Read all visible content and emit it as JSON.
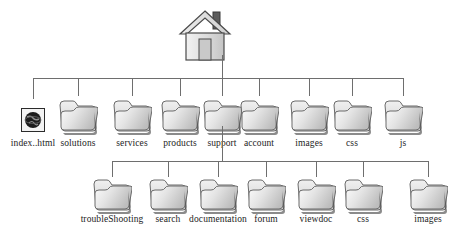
{
  "diagram": {
    "type": "site-map-tree",
    "background_color": "#ffffff",
    "line_color": "#6e6e6e",
    "root": {
      "icon": "house-icon",
      "label": ""
    },
    "level1": [
      {
        "label": "index..html",
        "icon": "globe-icon",
        "x": 33
      },
      {
        "label": "solutions",
        "icon": "folder-icon",
        "x": 78
      },
      {
        "label": "services",
        "icon": "folder-icon",
        "x": 132
      },
      {
        "label": "products",
        "icon": "folder-icon",
        "x": 180
      },
      {
        "label": "support",
        "icon": "folder-icon",
        "x": 222
      },
      {
        "label": "account",
        "icon": "folder-icon",
        "x": 259
      },
      {
        "label": "images",
        "icon": "folder-icon",
        "x": 309
      },
      {
        "label": "css",
        "icon": "folder-icon",
        "x": 352
      },
      {
        "label": "js",
        "icon": "folder-icon",
        "x": 403
      }
    ],
    "level2_parent": "support",
    "level2": [
      {
        "label": "troubleShooting",
        "icon": "folder-icon",
        "x": 112
      },
      {
        "label": "search",
        "icon": "folder-icon",
        "x": 168
      },
      {
        "label": "documentation",
        "icon": "folder-icon",
        "x": 218
      },
      {
        "label": "forum",
        "icon": "folder-icon",
        "x": 266
      },
      {
        "label": "viewdoc",
        "icon": "folder-icon",
        "x": 316
      },
      {
        "label": "css",
        "icon": "folder-icon",
        "x": 363
      },
      {
        "label": "images",
        "icon": "folder-icon",
        "x": 428
      }
    ]
  }
}
